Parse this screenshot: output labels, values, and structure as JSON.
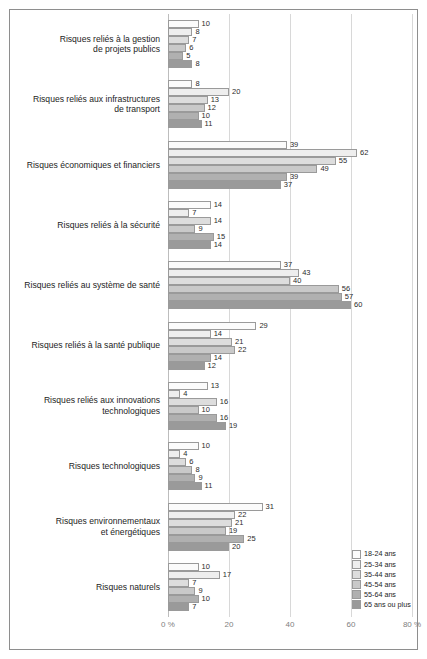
{
  "chart_data": {
    "type": "bar",
    "orientation": "horizontal",
    "title": "",
    "xlabel": "",
    "ylabel": "",
    "xlim": [
      0,
      80
    ],
    "grid": true,
    "legend_position": "bottom-right",
    "xticks": [
      "0 %",
      "20",
      "40",
      "60",
      "80 %"
    ],
    "xtick_values": [
      0,
      20,
      40,
      60,
      80
    ],
    "categories": [
      "Risques reliés à la gestion\nde projets publics",
      "Risques reliés aux infrastructures\nde transport",
      "Risques économiques et financiers",
      "Risques reliés à la sécurité",
      "Risques reliés au système de santé",
      "Risques reliés à la santé publique",
      "Risques reliés aux innovations\ntechnologiques",
      "Risques technologiques",
      "Risques environnementaux\net énergétiques",
      "Risques naturels"
    ],
    "series": [
      {
        "name": "18-24 ans",
        "color": "#fbfbfb",
        "values": [
          10,
          8,
          39,
          14,
          37,
          29,
          13,
          10,
          31,
          10
        ]
      },
      {
        "name": "25-34 ans",
        "color": "#eeeeee",
        "values": [
          8,
          20,
          62,
          7,
          43,
          14,
          4,
          4,
          22,
          17
        ]
      },
      {
        "name": "35-44 ans",
        "color": "#dddddd",
        "values": [
          7,
          13,
          55,
          14,
          40,
          21,
          16,
          6,
          21,
          7
        ]
      },
      {
        "name": "45-54 ans",
        "color": "#c9c9c9",
        "values": [
          6,
          12,
          49,
          9,
          56,
          22,
          10,
          8,
          19,
          9
        ]
      },
      {
        "name": "55-64 ans",
        "color": "#b0b0b0",
        "values": [
          5,
          10,
          39,
          15,
          57,
          14,
          16,
          9,
          25,
          10
        ]
      },
      {
        "name": "65 ans ou plus",
        "color": "#9a9a9a",
        "values": [
          8,
          11,
          37,
          14,
          60,
          12,
          19,
          11,
          20,
          7
        ]
      }
    ]
  },
  "legend": {
    "items": [
      {
        "label": "18-24 ans",
        "color": "#fbfbfb"
      },
      {
        "label": "25-34 ans",
        "color": "#eeeeee"
      },
      {
        "label": "35-44 ans",
        "color": "#dddddd"
      },
      {
        "label": "45-54 ans",
        "color": "#c9c9c9"
      },
      {
        "label": "55-64 ans",
        "color": "#b0b0b0"
      },
      {
        "label": "65 ans ou plus",
        "color": "#9a9a9a"
      }
    ]
  }
}
